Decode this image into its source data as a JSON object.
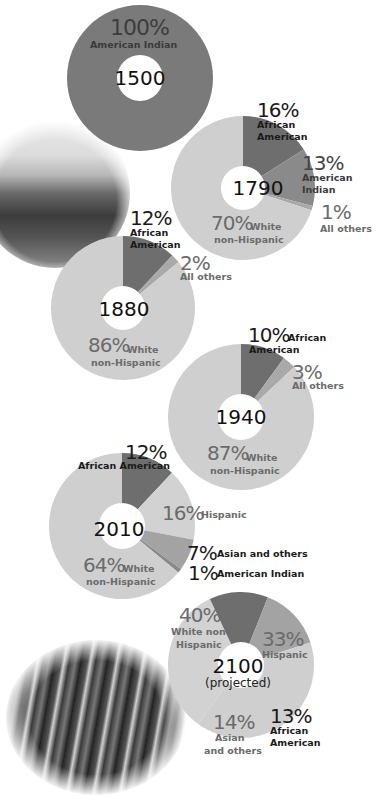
{
  "chart_data": [
    {
      "type": "pie",
      "style": "donut",
      "title": "1500",
      "categories": [
        "American Indian"
      ],
      "values": [
        100
      ],
      "labels": [
        "100%"
      ]
    },
    {
      "type": "pie",
      "style": "donut",
      "title": "1790",
      "categories": [
        "African American",
        "American Indian",
        "All others",
        "White non-Hispanic"
      ],
      "values": [
        16,
        13,
        1,
        70
      ],
      "labels": [
        "16%",
        "13%",
        "1%",
        "70%"
      ]
    },
    {
      "type": "pie",
      "style": "donut",
      "title": "1880",
      "categories": [
        "African American",
        "All others",
        "White non-Hispanic"
      ],
      "values": [
        12,
        2,
        86
      ],
      "labels": [
        "12%",
        "2%",
        "86%"
      ]
    },
    {
      "type": "pie",
      "style": "donut",
      "title": "1940",
      "categories": [
        "African American",
        "All others",
        "White non-Hispanic"
      ],
      "values": [
        10,
        3,
        87
      ],
      "labels": [
        "10%",
        "3%",
        "87%"
      ]
    },
    {
      "type": "pie",
      "style": "donut",
      "title": "2010",
      "categories": [
        "African American",
        "Hispanic",
        "Asian and others",
        "American Indian",
        "White non-Hispanic"
      ],
      "values": [
        12,
        16,
        7,
        1,
        64
      ],
      "labels": [
        "12%",
        "16%",
        "7%",
        "1%",
        "64%"
      ]
    },
    {
      "type": "pie",
      "style": "donut",
      "title": "2100 (projected)",
      "categories": [
        "Hispanic",
        "African American",
        "Asian and others",
        "White non-Hispanic"
      ],
      "values": [
        33,
        13,
        14,
        40
      ],
      "labels": [
        "33%",
        "13%",
        "14%",
        "40%"
      ]
    }
  ],
  "colors": {
    "american_indian_1500": "#7a7a7a",
    "african_american": "#6e6e6e",
    "american_indian": "#8a8a8a",
    "all_others": "#a9a9a9",
    "white_non_hispanic": "#cfcfcf",
    "hispanic": "#d2d2d2",
    "asian_and_others": "#a3a3a3",
    "center": "#ffffff"
  },
  "p1500": {
    "year": "1500",
    "pct": "100%",
    "cat": "American Indian"
  },
  "p1790": {
    "year": "1790",
    "aa_pct": "16%",
    "aa_cat1": "African",
    "aa_cat2": "American",
    "ai_pct": "13%",
    "ai_cat1": "American",
    "ai_cat2": "Indian",
    "ot_pct": "1%",
    "ot_cat": "All others",
    "wh_pct": "70%",
    "wh_cat1": "White",
    "wh_cat2": "non-Hispanic"
  },
  "p1880": {
    "year": "1880",
    "aa_pct": "12%",
    "aa_cat1": "African",
    "aa_cat2": "American",
    "ot_pct": "2%",
    "ot_cat": "All others",
    "wh_pct": "86%",
    "wh_cat1": "White",
    "wh_cat2": "non-Hispanic"
  },
  "p1940": {
    "year": "1940",
    "aa_pct": "10%",
    "aa_cat1": "African",
    "aa_cat2": "American",
    "ot_pct": "3%",
    "ot_cat": "All others",
    "wh_pct": "87%",
    "wh_cat1": "White",
    "wh_cat2": "non-Hispanic"
  },
  "p2010": {
    "year": "2010",
    "aa_pct": "12%",
    "aa_cat": "African American",
    "hi_pct": "16%",
    "hi_cat": "Hispanic",
    "as_pct": "7%",
    "as_cat": "Asian and others",
    "ai_pct": "1%",
    "ai_cat": "American Indian",
    "wh_pct": "64%",
    "wh_cat1": "White",
    "wh_cat2": "non-Hispanic"
  },
  "p2100": {
    "year": "2100",
    "sub": "(projected)",
    "wh_pct": "40%",
    "wh_cat1": "White non-",
    "wh_cat2": "Hispanic",
    "hi_pct": "33%",
    "hi_cat": "Hispanic",
    "aa_pct": "13%",
    "aa_cat1": "African",
    "aa_cat2": "American",
    "as_pct": "14%",
    "as_cat1": "Asian",
    "as_cat2": "and others"
  },
  "images": {
    "top_photo": "historical-painting-native-american-camp",
    "bottom_photo": "crowd-of-people"
  }
}
